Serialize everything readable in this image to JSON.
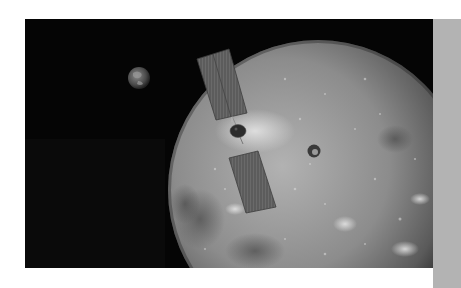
{
  "scene": {
    "description": "Spacecraft with two solar panels orbiting the Moon, Earth visible in the distance",
    "objects": {
      "earth": {
        "label": "Earth",
        "cx": 114,
        "cy": 59,
        "r": 11
      },
      "moon": {
        "label": "Moon",
        "cx": 293,
        "cy": 171,
        "r": 150,
        "crater": {
          "cx": 289,
          "cy": 132,
          "r": 6
        }
      },
      "spacecraft": {
        "label": "Spacecraft",
        "body": {
          "cx": 213,
          "cy": 112,
          "rx": 8,
          "ry": 6.5
        },
        "upper_panel": "172,40 204,30 222,94 191,101",
        "lower_panel": "204,139 233,132 251,188 221,194"
      }
    },
    "colors": {
      "space": "#050505",
      "moon_light": "#a8a8a8",
      "moon_mid": "#7a7a7a",
      "moon_dark": "#2a2a2a",
      "panel": "#5e5e5e",
      "page_background": "#ffffff",
      "side_strip": "#b3b3b3"
    }
  }
}
